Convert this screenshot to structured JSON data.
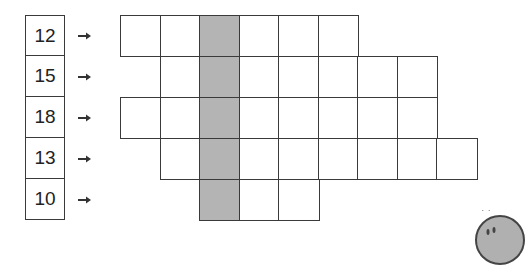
{
  "diagram": {
    "colors": {
      "line": "#3a3a3a",
      "shaded": "#b4b4b4",
      "cell": "#ffffff"
    },
    "grid": {
      "origin_x": 120,
      "origin_y": 15,
      "cell_w": 39.5,
      "cell_h": 41,
      "shaded_column": 2
    },
    "rows": [
      {
        "number": "12",
        "start_col": 0,
        "end_col": 5
      },
      {
        "number": "15",
        "start_col": 1,
        "end_col": 7
      },
      {
        "number": "18",
        "start_col": 0,
        "end_col": 7
      },
      {
        "number": "13",
        "start_col": 1,
        "end_col": 8
      },
      {
        "number": "10",
        "start_col": 2,
        "end_col": 4
      }
    ],
    "arrow_icon": "right-arrow-icon",
    "decoration": "partial-character-face-icon"
  }
}
